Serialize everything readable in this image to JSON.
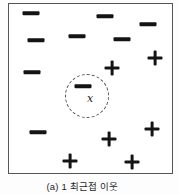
{
  "diagram": {
    "caption": "(a) 1 최근접 이웃",
    "query_label": "x",
    "colors": {
      "symbol": "#141414",
      "frame_border": "#565656",
      "circle_border": "#4a4a4a",
      "background": "#ffffff",
      "caption_text": "#1f1f1f"
    },
    "frame": {
      "x": 8,
      "y": 3,
      "width": 165,
      "height": 171
    },
    "neighborhood_circle": {
      "cx": 87,
      "cy": 96,
      "r": 22,
      "style": "dashed"
    },
    "query_point": {
      "x": 90,
      "y": 99
    },
    "points": [
      {
        "class": "negative",
        "symbol": "minus",
        "x": 31,
        "y": 13
      },
      {
        "class": "negative",
        "symbol": "minus",
        "x": 105,
        "y": 16
      },
      {
        "class": "negative",
        "symbol": "minus",
        "x": 148,
        "y": 24
      },
      {
        "class": "negative",
        "symbol": "minus",
        "x": 36,
        "y": 40
      },
      {
        "class": "negative",
        "symbol": "minus",
        "x": 77,
        "y": 36
      },
      {
        "class": "negative",
        "symbol": "minus",
        "x": 122,
        "y": 39
      },
      {
        "class": "negative",
        "symbol": "minus",
        "x": 32,
        "y": 72
      },
      {
        "class": "negative",
        "symbol": "minus",
        "x": 83,
        "y": 86
      },
      {
        "class": "negative",
        "symbol": "minus",
        "x": 38,
        "y": 132
      },
      {
        "class": "positive",
        "symbol": "plus",
        "x": 155,
        "y": 58
      },
      {
        "class": "positive",
        "symbol": "plus",
        "x": 112,
        "y": 68
      },
      {
        "class": "positive",
        "symbol": "plus",
        "x": 152,
        "y": 129
      },
      {
        "class": "positive",
        "symbol": "plus",
        "x": 109,
        "y": 139
      },
      {
        "class": "positive",
        "symbol": "plus",
        "x": 70,
        "y": 161
      },
      {
        "class": "positive",
        "symbol": "plus",
        "x": 132,
        "y": 162
      }
    ]
  }
}
